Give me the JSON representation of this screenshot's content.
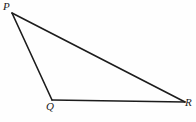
{
  "figure": {
    "name": "triangle-PQR",
    "type": "geometry-diagram",
    "canvas": {
      "width": 196,
      "height": 122
    },
    "background_color": "#fefefe",
    "stroke_color": "#1c1c1c",
    "stroke_width": 1.6,
    "label_color": "#1a1a1a",
    "label_font_style": "italic-serif",
    "label_font_size": 11
  },
  "vertices": [
    {
      "id": "P",
      "label": "P",
      "x": 12,
      "y": 13,
      "label_x": 3,
      "label_y": 1
    },
    {
      "id": "Q",
      "label": "Q",
      "x": 52,
      "y": 100,
      "label_x": 46,
      "label_y": 101
    },
    {
      "id": "R",
      "label": "R",
      "x": 185,
      "y": 102,
      "label_x": 185,
      "label_y": 97
    }
  ],
  "edges": [
    {
      "id": "PQ",
      "from": "P",
      "to": "Q"
    },
    {
      "id": "QR",
      "from": "Q",
      "to": "R"
    },
    {
      "id": "RP",
      "from": "R",
      "to": "P"
    }
  ]
}
